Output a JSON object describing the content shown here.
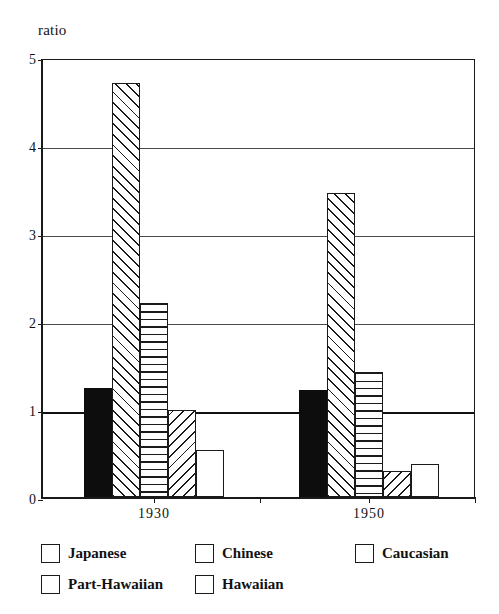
{
  "chart_data": {
    "type": "bar",
    "title": "",
    "xlabel": "",
    "ylabel": "ratio",
    "ylim": [
      0,
      5
    ],
    "yticks": [
      0,
      1,
      2,
      3,
      4,
      5
    ],
    "ytick_labels": [
      "0",
      "1",
      "2",
      "3",
      "4",
      "5"
    ],
    "grid": true,
    "reference_line": 1,
    "legend_position": "bottom",
    "categories": [
      "1930",
      "1950"
    ],
    "series": [
      {
        "name": "Japanese",
        "pattern": "solid-black",
        "values": [
          1.24,
          1.22
        ]
      },
      {
        "name": "Chinese",
        "pattern": "diagonal-forward",
        "values": [
          4.7,
          3.45
        ]
      },
      {
        "name": "Caucasian",
        "pattern": "horizontal-lines",
        "values": [
          2.2,
          1.42
        ]
      },
      {
        "name": "Part-Hawaiian",
        "pattern": "diagonal-backward",
        "values": [
          0.99,
          0.29
        ]
      },
      {
        "name": "Hawaiian",
        "pattern": "empty-white",
        "values": [
          0.53,
          0.37
        ]
      }
    ]
  },
  "legend": {
    "rows": [
      [
        {
          "label": "Japanese",
          "swatch": "solid-black-swatch"
        },
        {
          "label": "Chinese",
          "swatch": "diagonal-forward-swatch"
        },
        {
          "label": "Caucasian",
          "swatch": "horizontal-lines-swatch"
        }
      ],
      [
        {
          "label": "Part-Hawaiian",
          "swatch": "diagonal-backward-swatch"
        },
        {
          "label": "Hawaiian",
          "swatch": "empty-white-swatch"
        }
      ]
    ]
  },
  "colors": {
    "ink": "#1a1a1a",
    "fill_solid": "#0d0d0d",
    "background": "#ffffff",
    "gridline": "#4a4a4a"
  }
}
